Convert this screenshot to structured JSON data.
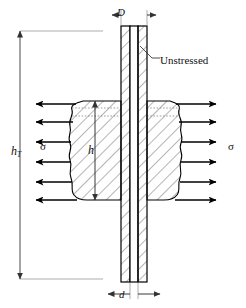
{
  "figure": {
    "type": "engineering-cross-section",
    "width": 246,
    "height": 308,
    "background": "#ffffff",
    "line_color": "#000000",
    "hatch_color": "#555555",
    "dim_color": "#444444"
  },
  "labels": {
    "total_height": "h",
    "total_height_sub": "T",
    "plate_height": "h",
    "outer_diameter": "D",
    "inner_diameter": "d",
    "stress_left": "σ",
    "stress_right": "σ",
    "unstressed": "Unstressed"
  },
  "dimensions": [
    {
      "name": "h_T",
      "orientation": "vertical",
      "side": "left",
      "label": "h",
      "subscript": "T"
    },
    {
      "name": "h",
      "orientation": "vertical",
      "side": "inner",
      "label": "h",
      "subscript": ""
    },
    {
      "name": "D",
      "orientation": "horizontal",
      "side": "top",
      "label": "D",
      "subscript": ""
    },
    {
      "name": "d",
      "orientation": "horizontal",
      "side": "bottom",
      "label": "d",
      "subscript": ""
    }
  ],
  "stress_arrows": {
    "left": {
      "count": 6,
      "direction": "left",
      "label": "σ"
    },
    "right": {
      "count": 6,
      "direction": "right",
      "label": "σ"
    }
  },
  "annotation": {
    "text": "Unstressed",
    "leader": true,
    "points_to": "bolt-shaft-upper"
  },
  "geometry": {
    "shaft_left_x": 121,
    "shaft_right_x": 147,
    "shaft_top_y": 26,
    "shaft_bottom_y": 282,
    "plate_top_y": 101,
    "plate_bottom_y": 200,
    "plate_left_x": 70,
    "plate_right_x": 182,
    "dim_line_x": 20,
    "dim_top_y": 31,
    "dim_bottom_y": 279
  }
}
